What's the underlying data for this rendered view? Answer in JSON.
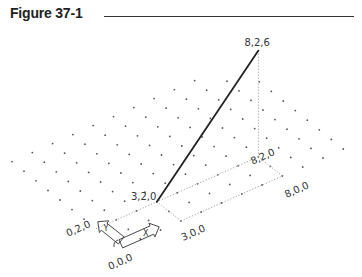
{
  "figure": {
    "title": "Figure 37-1"
  },
  "projection": {
    "origin_px": [
      120,
      248
    ],
    "x_unit_px": [
      20.3,
      -9.0
    ],
    "y_unit_px": [
      -12.0,
      -9.6
    ],
    "z_unit_px": [
      0,
      -17.7
    ]
  },
  "grid": {
    "x_range": [
      0,
      11
    ],
    "y_range": [
      0,
      9
    ],
    "dot_color": "#555555"
  },
  "line": {
    "from": [
      3,
      2,
      0
    ],
    "to": [
      8,
      2,
      6
    ],
    "color": "#222222"
  },
  "reference_lines": [
    {
      "from": [
        0,
        2,
        0
      ],
      "to": [
        8,
        2,
        0
      ]
    },
    {
      "from": [
        3,
        0,
        0
      ],
      "to": [
        8,
        0,
        0
      ]
    },
    {
      "from": [
        3,
        0,
        0
      ],
      "to": [
        3,
        2,
        0
      ]
    },
    {
      "from": [
        8,
        0,
        0
      ],
      "to": [
        8,
        2,
        0
      ]
    },
    {
      "from": [
        8,
        2,
        0
      ],
      "to": [
        8,
        2,
        6
      ]
    }
  ],
  "labels": [
    {
      "text": "8,2,6",
      "at": [
        8,
        2,
        6
      ],
      "dx": -14,
      "dy": -5,
      "rotate": 0
    },
    {
      "text": "3,2,0",
      "at": [
        3,
        2,
        0
      ],
      "dx": -26,
      "dy": -2,
      "rotate": 0
    },
    {
      "text": "8,2,0",
      "at": [
        8,
        2,
        0
      ],
      "dx": -6,
      "dy": 8,
      "rotate": -24
    },
    {
      "text": "8,0,0",
      "at": [
        8,
        0,
        0
      ],
      "dx": 4,
      "dy": 22,
      "rotate": -24
    },
    {
      "text": "3,0,0",
      "at": [
        3,
        0,
        0
      ],
      "dx": 2,
      "dy": 20,
      "rotate": -24
    },
    {
      "text": "0,2,0",
      "at": [
        0,
        2,
        0
      ],
      "dx": -28,
      "dy": 8,
      "rotate": -24
    },
    {
      "text": "0,0,0",
      "at": [
        0,
        0,
        0
      ],
      "dx": -10,
      "dy": 22,
      "rotate": -24
    }
  ],
  "ucs_icon": {
    "x_label": "X",
    "y_label": "Y"
  }
}
